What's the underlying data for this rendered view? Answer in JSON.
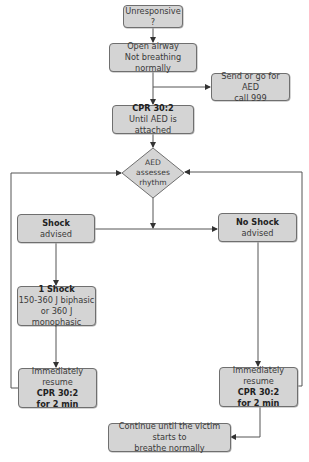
{
  "flowchart": {
    "title": "AED resuscitation algorithm",
    "nodes": {
      "unresponsive": {
        "line1": "Unresponsive ?"
      },
      "open_airway": {
        "line1": "Open airway",
        "line2": "Not breathing normally"
      },
      "send_aed": {
        "line1": "Send or go for AED",
        "line2": "call 999"
      },
      "cpr_until_aed": {
        "line1": "CPR 30:2",
        "line2": "Until AED is attached"
      },
      "aed_assesses": {
        "line1": "AED",
        "line2": "assesses",
        "line3": "rhythm"
      },
      "shock_advised": {
        "line1": "Shock",
        "line2": "advised"
      },
      "no_shock_advised": {
        "line1": "No Shock",
        "line2": "advised"
      },
      "one_shock": {
        "line1": "1 Shock",
        "line2": "150-360 J biphasic",
        "line3": "or 360 J monophasic"
      },
      "resume_left": {
        "line1": "Immediately resume",
        "line2": "CPR 30:2",
        "line3": "for 2 min"
      },
      "resume_right": {
        "line1": "Immediately resume",
        "line2": "CPR 30:2",
        "line3": "for 2 min"
      },
      "continue": {
        "line1": "Continue until the victim starts to",
        "line2": "breathe normally"
      }
    },
    "colors": {
      "box_fill": "#d4d4d4",
      "box_border": "#6f6f6f",
      "line": "#444444"
    }
  }
}
